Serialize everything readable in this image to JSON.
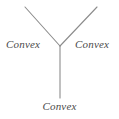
{
  "figure": {
    "background_color": "#ffffff",
    "line_color": "#8c8c8c",
    "text_color": "#4a4a4a",
    "width": 119,
    "height": 119
  },
  "junction": {
    "type": "Y-junction",
    "vertex": {
      "x": 60,
      "y": 46
    },
    "branches": [
      {
        "name": "upper-left-arm",
        "from": {
          "x": 60,
          "y": 46
        },
        "to": {
          "x": 25,
          "y": 7
        }
      },
      {
        "name": "upper-right-arm",
        "from": {
          "x": 60,
          "y": 46
        },
        "to": {
          "x": 97,
          "y": 7
        }
      },
      {
        "name": "lower-stem",
        "from": {
          "x": 60,
          "y": 46
        },
        "to": {
          "x": 60,
          "y": 98
        }
      }
    ]
  },
  "labels": {
    "left": "Convex",
    "right": "Convex",
    "bottom": "Convex"
  }
}
